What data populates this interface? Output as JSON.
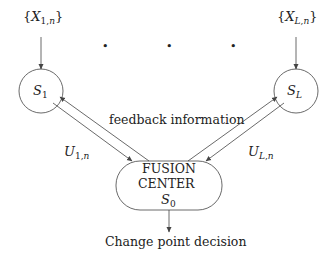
{
  "diagram": {
    "type": "block-diagram",
    "inputs": [
      {
        "id": "x1",
        "brace_open": "{",
        "var": "X",
        "sub_index": "1",
        "sub_sep": ",",
        "sub_n": "n",
        "brace_close": "}"
      },
      {
        "id": "xL",
        "brace_open": "{",
        "var": "X",
        "sub_index": "L",
        "sub_sep": ",",
        "sub_n": "n",
        "brace_close": "}"
      }
    ],
    "sensors": [
      {
        "id": "s1",
        "var": "S",
        "sub": "1"
      },
      {
        "id": "sL",
        "var": "S",
        "sub": "L"
      }
    ],
    "ellipsis_dots": [
      "•",
      "•",
      "•"
    ],
    "feedback_label": "feedback information",
    "messages": [
      {
        "id": "u1",
        "var": "U",
        "sub_index": "1",
        "sub_sep": ",",
        "sub_n": "n"
      },
      {
        "id": "uL",
        "var": "U",
        "sub_index": "L",
        "sub_sep": ",",
        "sub_n": "n"
      }
    ],
    "fusion_center": {
      "line1": "FUSION",
      "line2": "CENTER",
      "var": "S",
      "sub": "0"
    },
    "output_label": "Change point decision",
    "colors": {
      "stroke": "#444444",
      "text": "#222222",
      "background": "#ffffff"
    }
  }
}
